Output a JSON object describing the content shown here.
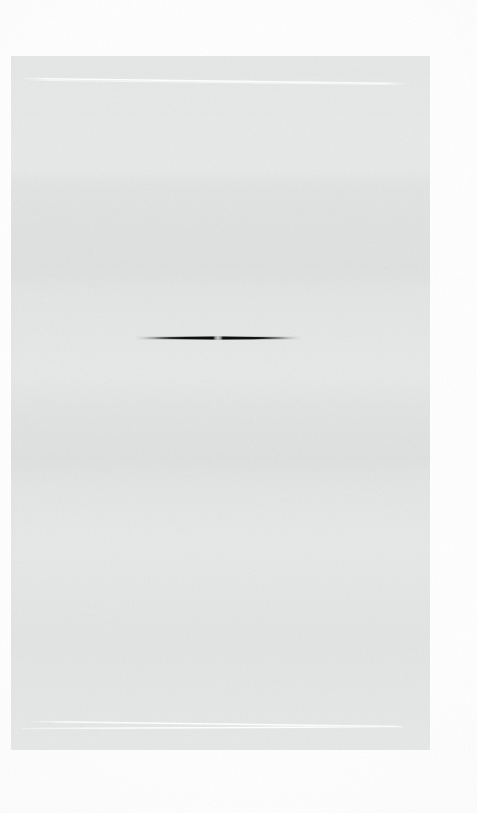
{
  "document": {
    "title": "Faded scanned page",
    "background_color": "#ffffff",
    "width": 477,
    "height": 813
  },
  "panel": {
    "name": "light gray panel",
    "fill_color": "#e6e7e7",
    "x": 11,
    "y": 56,
    "width": 419,
    "height": 694
  },
  "marks": {
    "top_rule": {
      "label": "bright white slanted rule (upper)",
      "color": "#ffffff",
      "x1": 24,
      "y1": 79,
      "x2": 406,
      "y2": 85
    },
    "bottom_rule_upper": {
      "label": "bright white slanted rule (lower, upper stroke)",
      "color": "#ffffff",
      "x1": 30,
      "y1": 722,
      "x2": 404,
      "y2": 727
    },
    "bottom_rule_lower": {
      "label": "bright white slanted rule (lower, lower stroke)",
      "color": "#ffffff",
      "x1": 22,
      "y1": 729,
      "x2": 403,
      "y2": 727
    },
    "needle": {
      "label": "dark tapered horizontal needle",
      "color": "#121212",
      "x_start": 138,
      "x_end": 296,
      "y_center": 338,
      "max_thickness": 3,
      "notch_x": 215,
      "notch_color": "#d8d8d8"
    }
  },
  "caption": {
    "text": "Washed-out scan: pale gray panel with two white rules and a dark needle"
  }
}
